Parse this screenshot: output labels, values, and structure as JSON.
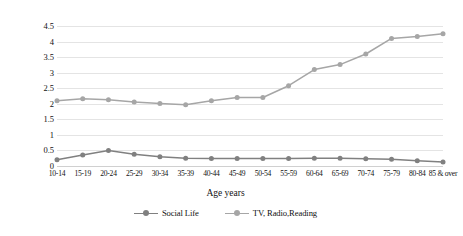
{
  "chart_data": {
    "type": "line",
    "title": "",
    "xlabel": "Age years",
    "ylabel": "Hour minutes spent daily by age group",
    "ylim": [
      0,
      4.5
    ],
    "yticks": [
      "0",
      "0.5",
      "1",
      "1.5",
      "2",
      "2.5",
      "3",
      "3.5",
      "4",
      "4.5"
    ],
    "ytick_values": [
      0,
      0.5,
      1,
      1.5,
      2,
      2.5,
      3,
      3.5,
      4,
      4.5
    ],
    "grid": true,
    "legend_position": "bottom-center",
    "categories": [
      "10-14",
      "15-19",
      "20-24",
      "25-29",
      "30-34",
      "35-39",
      "40-44",
      "45-49",
      "50-54",
      "55-59",
      "60-64",
      "65-69",
      "70-74",
      "75-79",
      "80-84",
      "85 & over"
    ],
    "series": [
      {
        "name": "Social Life",
        "color": "#808080",
        "values": [
          0.2,
          0.35,
          0.5,
          0.38,
          0.3,
          0.25,
          0.24,
          0.24,
          0.24,
          0.24,
          0.25,
          0.25,
          0.23,
          0.22,
          0.17,
          0.13
        ]
      },
      {
        "name": "TV, Radio,Reading",
        "color": "#a6a6a6",
        "values": [
          2.1,
          2.16,
          2.13,
          2.06,
          2.01,
          1.97,
          2.1,
          2.2,
          2.2,
          2.58,
          3.1,
          3.26,
          3.6,
          4.1,
          4.16,
          4.25
        ]
      }
    ]
  },
  "legend": {
    "items": [
      {
        "label": "Social Life",
        "color": "#808080"
      },
      {
        "label": "TV, Radio,Reading",
        "color": "#a6a6a6"
      }
    ]
  }
}
